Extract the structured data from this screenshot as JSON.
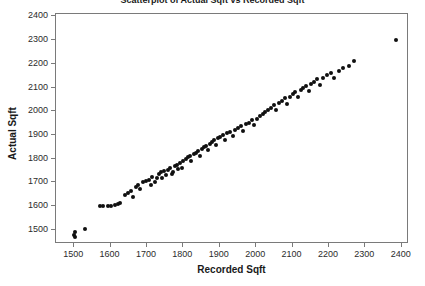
{
  "chart_data": {
    "type": "scatter",
    "title": "Scatterplot of Actual Sqft vs Recorded Sqft",
    "xlabel": "Recorded Sqft",
    "ylabel": "Actual Sqft",
    "xlim": [
      1450,
      2420
    ],
    "ylim": [
      1440,
      2410
    ],
    "xticks": [
      1500,
      1600,
      1700,
      1800,
      1900,
      2000,
      2100,
      2200,
      2300,
      2400
    ],
    "yticks": [
      1500,
      1600,
      1700,
      1800,
      1900,
      2000,
      2100,
      2200,
      2300,
      2400
    ],
    "grid": false,
    "legend": null,
    "marker": "filled-circle",
    "marker_color": "#101010",
    "points": [
      [
        1500,
        1478
      ],
      [
        1502,
        1468
      ],
      [
        1503,
        1490
      ],
      [
        1530,
        1505
      ],
      [
        1570,
        1600
      ],
      [
        1580,
        1600
      ],
      [
        1592,
        1600
      ],
      [
        1600,
        1601
      ],
      [
        1612,
        1605
      ],
      [
        1620,
        1608
      ],
      [
        1625,
        1612
      ],
      [
        1640,
        1645
      ],
      [
        1648,
        1655
      ],
      [
        1655,
        1662
      ],
      [
        1662,
        1640
      ],
      [
        1670,
        1680
      ],
      [
        1676,
        1688
      ],
      [
        1682,
        1672
      ],
      [
        1690,
        1700
      ],
      [
        1698,
        1705
      ],
      [
        1705,
        1712
      ],
      [
        1710,
        1690
      ],
      [
        1715,
        1722
      ],
      [
        1722,
        1700
      ],
      [
        1728,
        1718
      ],
      [
        1732,
        1735
      ],
      [
        1738,
        1742
      ],
      [
        1742,
        1720
      ],
      [
        1748,
        1748
      ],
      [
        1752,
        1730
      ],
      [
        1758,
        1752
      ],
      [
        1762,
        1760
      ],
      [
        1768,
        1735
      ],
      [
        1772,
        1742
      ],
      [
        1778,
        1768
      ],
      [
        1782,
        1775
      ],
      [
        1786,
        1755
      ],
      [
        1790,
        1782
      ],
      [
        1795,
        1762
      ],
      [
        1800,
        1790
      ],
      [
        1806,
        1798
      ],
      [
        1812,
        1805
      ],
      [
        1818,
        1812
      ],
      [
        1822,
        1790
      ],
      [
        1828,
        1818
      ],
      [
        1834,
        1825
      ],
      [
        1840,
        1832
      ],
      [
        1845,
        1810
      ],
      [
        1850,
        1840
      ],
      [
        1856,
        1848
      ],
      [
        1862,
        1855
      ],
      [
        1868,
        1835
      ],
      [
        1872,
        1862
      ],
      [
        1878,
        1870
      ],
      [
        1884,
        1878
      ],
      [
        1890,
        1858
      ],
      [
        1896,
        1885
      ],
      [
        1902,
        1892
      ],
      [
        1908,
        1900
      ],
      [
        1914,
        1880
      ],
      [
        1920,
        1908
      ],
      [
        1928,
        1912
      ],
      [
        1935,
        1895
      ],
      [
        1942,
        1920
      ],
      [
        1950,
        1928
      ],
      [
        1958,
        1938
      ],
      [
        1965,
        1918
      ],
      [
        1972,
        1945
      ],
      [
        1980,
        1952
      ],
      [
        1988,
        1962
      ],
      [
        1995,
        1940
      ],
      [
        2002,
        1968
      ],
      [
        2010,
        1978
      ],
      [
        2018,
        1988
      ],
      [
        2025,
        1998
      ],
      [
        2032,
        2005
      ],
      [
        2040,
        2015
      ],
      [
        2048,
        2025
      ],
      [
        2055,
        2005
      ],
      [
        2062,
        2035
      ],
      [
        2070,
        2045
      ],
      [
        2078,
        2055
      ],
      [
        2085,
        2032
      ],
      [
        2092,
        2062
      ],
      [
        2100,
        2072
      ],
      [
        2108,
        2082
      ],
      [
        2115,
        2060
      ],
      [
        2122,
        2090
      ],
      [
        2130,
        2098
      ],
      [
        2138,
        2108
      ],
      [
        2145,
        2085
      ],
      [
        2152,
        2115
      ],
      [
        2160,
        2125
      ],
      [
        2168,
        2135
      ],
      [
        2175,
        2110
      ],
      [
        2185,
        2142
      ],
      [
        2195,
        2152
      ],
      [
        2205,
        2162
      ],
      [
        2215,
        2140
      ],
      [
        2228,
        2170
      ],
      [
        2240,
        2182
      ],
      [
        2255,
        2192
      ],
      [
        2268,
        2210
      ],
      [
        2385,
        2300
      ]
    ]
  }
}
